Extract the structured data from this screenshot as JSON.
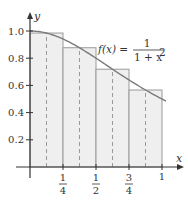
{
  "chart_data": {
    "type": "area",
    "title": "",
    "function_label": {
      "lhs": "f(x) =",
      "numerator": "1",
      "denominator": "1 + x"
    },
    "function_exponent": "2",
    "xlabel": "x",
    "ylabel": "y",
    "xlim": [
      0,
      1
    ],
    "ylim": [
      0,
      1
    ],
    "x_ticks": [
      {
        "value": 0.25,
        "num": "1",
        "den": "4"
      },
      {
        "value": 0.5,
        "num": "1",
        "den": "2"
      },
      {
        "value": 0.75,
        "num": "3",
        "den": "4"
      },
      {
        "value": 1,
        "label": "1"
      }
    ],
    "y_ticks": [
      {
        "value": 0.2,
        "label": "0.2"
      },
      {
        "value": 0.4,
        "label": "0.4"
      },
      {
        "value": 0.6,
        "label": "0.6"
      },
      {
        "value": 0.8,
        "label": "0.8"
      },
      {
        "value": 1.0,
        "label": "1.0"
      }
    ],
    "rectangles": [
      {
        "x0": 0,
        "x1": 0.25,
        "midpoint": 0.125,
        "height": 0.985
      },
      {
        "x0": 0.25,
        "x1": 0.5,
        "midpoint": 0.375,
        "height": 0.877
      },
      {
        "x0": 0.5,
        "x1": 0.75,
        "midpoint": 0.625,
        "height": 0.719
      },
      {
        "x0": 0.75,
        "x1": 1,
        "midpoint": 0.875,
        "height": 0.566
      }
    ],
    "curve": {
      "expression": "1/(1+x^2)",
      "x_range": [
        0,
        1.03
      ]
    },
    "colors": {
      "rect_fill": "#efefef",
      "rect_stroke": "#9a9a9a",
      "curve": "#7a7a7a",
      "axis": "#333333",
      "dash": "#9a9a9a"
    }
  }
}
